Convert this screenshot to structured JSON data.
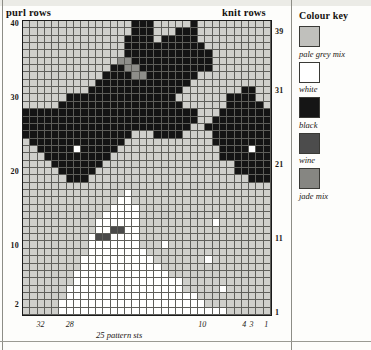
{
  "scan_header": "",
  "chart": {
    "purl_rows_label": "purl rows",
    "knit_rows_label": "knit rows",
    "pattern_sts_caption": "25 pattern sts",
    "columns": 34,
    "rows": 40,
    "row_numbers_left": [
      {
        "row": 40,
        "label": "40"
      },
      {
        "row": 30,
        "label": "30"
      },
      {
        "row": 20,
        "label": "20"
      },
      {
        "row": 10,
        "label": "10"
      },
      {
        "row": 2,
        "label": "2"
      }
    ],
    "row_numbers_right": [
      {
        "row": 39,
        "label": "39"
      },
      {
        "row": 31,
        "label": "31"
      },
      {
        "row": 21,
        "label": "21"
      },
      {
        "row": 11,
        "label": "11"
      },
      {
        "row": 1,
        "label": "1"
      }
    ],
    "stitch_numbers_bottom": [
      {
        "stitch": 32,
        "label": "32"
      },
      {
        "stitch": 28,
        "label": "28"
      },
      {
        "stitch": 10,
        "label": "10"
      },
      {
        "stitch": 4,
        "label": "4"
      },
      {
        "stitch": 3,
        "label": "3"
      },
      {
        "stitch": 1,
        "label": "1"
      }
    ]
  },
  "colour_key": {
    "title": "Colour key",
    "entries": [
      {
        "code": "g",
        "label": "pale grey mix",
        "hex": "#c0c0bc"
      },
      {
        "code": "w",
        "label": "white",
        "hex": "#ffffff"
      },
      {
        "code": "k",
        "label": "black",
        "hex": "#151515"
      },
      {
        "code": "n",
        "label": "wine",
        "hex": "#4c4c4c"
      },
      {
        "code": "j",
        "label": "jade mix",
        "hex": "#868682"
      }
    ]
  },
  "chart_data": {
    "type": "heatmap",
    "xlabel": "25 pattern sts",
    "ylabel": "rows",
    "legend_position": "right",
    "grid": true,
    "cols": 34,
    "rows": 40,
    "palette": {
      "g": "#cfcfcb",
      "w": "#ffffff",
      "k": "#141414",
      "n": "#4a4a4a",
      "j": "#8e8e8a"
    },
    "row_order": "top_row_is_row_40",
    "cells": [
      "gggggggggggggggkkkgggggkgggggggggg",
      "gggggggggggggggkkkgggkkkgggggggggg",
      "ggggggggggggggkkkkgkkkkkgggggggggg",
      "ggggggggggggggkkkkkkkkkkkggggggggg",
      "ggggggggggggggkkkkkkkkkkkkgggggggg",
      "gggggggggggggjjkkkkkkkkkkkgggggggg",
      "ggggggggggggkkjjkkkkkkkkkkgggggggg",
      "gggggggggggkkkkjjkkkkkkkgggggggggg",
      "ggggggggggkkkkkkkkkkkkkggggggggggg",
      "gggggggggkkkkkkkkkkkkkggggggggkkggg",
      "ggggggkkkkkkkkkkkkkkkgggggggkkkkggg",
      "gggggkkkkkkkkkkkkkkkkkggggggkkkkkgg",
      "kkkkkkkkkkkkkkkkkkkkkkkkgggkkkkkkkk",
      "kkkkkkkkkkkkkkkkkkkkkkkkggkkkkkkkkk",
      "kkkkkkkkkkkkkkkkkkkkkkkggkkkkkkkkkk",
      "kkkkkkkkkkkkkkkgggkkkkggggkkkkkkkkk",
      "gkkkkkkkkkkkkkggggggggggggkkkkkkkkk",
      "ggkkkkkwkkkkkggggggggggggggkkkkwkkk",
      "gggkkkkkkkkkgggggggggggggggkkkkkkkk",
      "ggggkkkkkkkggggggggggggggggggkkkkkk",
      "gggggkkkkkgggggggggggggggggggkkkkkk",
      "ggggggkkkggggggggggggggggggggggkkkg",
      "ggggggggggggggggggggggggggggggggggg",
      "ggggggggggggggwggggggggggggggggggg",
      "gggggggggggggwwgggggggggggggggggggg",
      "ggggggggggggwwwwgggggggggggggggggg",
      "gggggggggggwwwwwgggggggggggggggggg",
      "ggggggggggwwwwwwggggggggggwgggggggg",
      "ggggggggggwwnnwwgggggggggggggggggg",
      "gggggggggwnnwwwwgggggggggggggggggg",
      "gggggggggwwwwwwwgggwggggggggggggggg",
      "gggggggggwwwwwwwwggggggggggggggggg",
      "ggggggggwwwwwwwwwwgggggggwggggggggg",
      "ggggggggwwwwwwwwwwwgggggggggggggggg",
      "gggggggwwwwwwwwwwwwwgggggggggggggg",
      "gggggggwwwwwwwwwwwwwwwggggggggggggg",
      "ggggggwwwwwwwwwwwwwwwwgggggwgggggg",
      "ggggggwwwwwwwwwwwwwwwwwwgggggggggg",
      "gggggwwwwwwwwwwwwwwwwwwwwgggggggggg",
      "gggggwwwwwwwwwwwwwwwwwwwwwwwgggggg"
    ]
  }
}
